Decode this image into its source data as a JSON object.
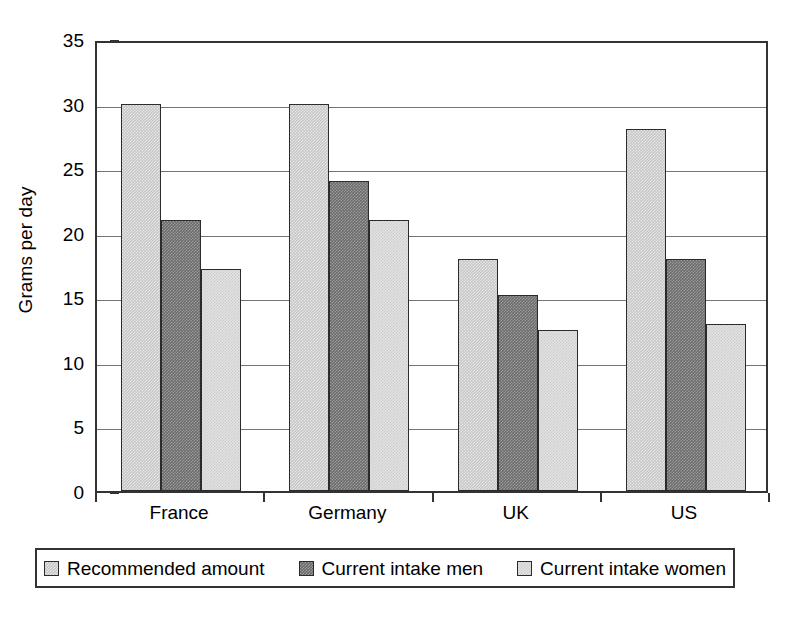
{
  "chart_data": {
    "type": "bar",
    "title": "",
    "xlabel": "",
    "ylabel": "Grams per day",
    "categories": [
      "France",
      "Germany",
      "UK",
      "US"
    ],
    "series": [
      {
        "name": "Recommended amount",
        "values": [
          30,
          30,
          18,
          28
        ],
        "color": "#c6c6c6"
      },
      {
        "name": "Current intake men",
        "values": [
          21,
          24,
          15.2,
          18
        ],
        "color": "#6b6b6b"
      },
      {
        "name": "Current intake women",
        "values": [
          17.2,
          21,
          12.5,
          12.9
        ],
        "color": "#e2e2e2"
      }
    ],
    "ylim": [
      0,
      35
    ],
    "ytick_values": [
      0,
      5,
      10,
      15,
      20,
      25,
      30,
      35
    ],
    "ytick_labels": [
      "0",
      "5",
      "10",
      "15",
      "20",
      "25",
      "30",
      "35"
    ],
    "grid": "horizontal",
    "legend_position": "bottom",
    "frame": true
  },
  "legend": {
    "entries": [
      {
        "label": "Recommended amount",
        "swatch": "series-0-swatch"
      },
      {
        "label": "Current intake men",
        "swatch": "series-1-swatch"
      },
      {
        "label": "Current intake women",
        "swatch": "series-2-swatch"
      }
    ]
  }
}
